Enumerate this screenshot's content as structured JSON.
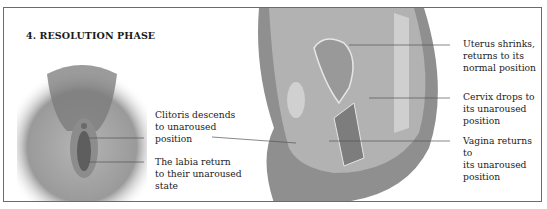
{
  "figure": {
    "title": "4. RESOLUTION PHASE",
    "left_panel": {
      "description": "External view illustration",
      "labels": [
        {
          "id": "clitoris",
          "text": "Clitoris descends\nto unaroused\nposition"
        },
        {
          "id": "labia",
          "text": "The labia return\nto their unaroused\nstate"
        }
      ]
    },
    "right_panel": {
      "description": "Cross-section illustration",
      "labels": [
        {
          "id": "uterus",
          "text": "Uterus shrinks,\nreturns to its\nnormal position"
        },
        {
          "id": "cervix",
          "text": "Cervix drops to\nits unaroused\nposition"
        },
        {
          "id": "vagina",
          "text": "Vagina returns to\nits unaroused\nposition"
        }
      ]
    },
    "colors": {
      "border": "#6b6b6b",
      "text": "#222222",
      "illustration_dark": "#4a4a4a",
      "illustration_mid": "#8a8a8a",
      "illustration_light": "#c8c8c8"
    }
  }
}
